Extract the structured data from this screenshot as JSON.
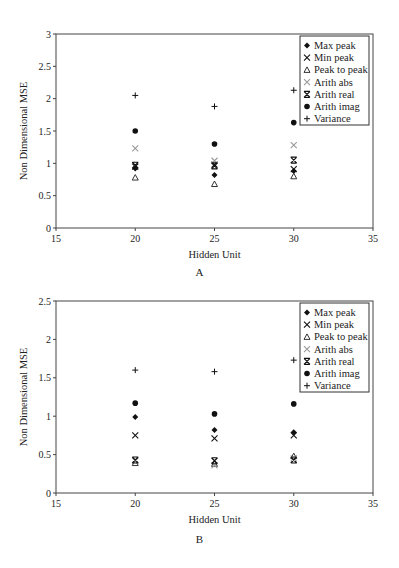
{
  "chart_data": [
    {
      "id": "A",
      "type": "scatter",
      "caption": "A",
      "title": "",
      "xlabel": "Hidden Unit",
      "ylabel": "Non Dimensional MSE",
      "xlim": [
        15,
        35
      ],
      "ylim": [
        0,
        3
      ],
      "xticks": [
        15,
        20,
        25,
        30,
        35
      ],
      "yticks": [
        0,
        0.5,
        1,
        1.5,
        2,
        2.5,
        3
      ],
      "ytick_labels": [
        "0",
        "0.5",
        "1",
        "1.5",
        "2",
        "2.5",
        "3"
      ],
      "grid": false,
      "legend_position": "upper right",
      "x": [
        20,
        25,
        30
      ],
      "series": [
        {
          "name": "Max peak",
          "marker": "diamond",
          "color": "#111111",
          "values": [
            0.92,
            0.82,
            0.88
          ]
        },
        {
          "name": "Min peak",
          "marker": "x",
          "color": "#111111",
          "values": [
            0.95,
            0.98,
            0.91
          ]
        },
        {
          "name": "Peak to peak",
          "marker": "triangle",
          "color": "#333333",
          "values": [
            0.78,
            0.68,
            0.8
          ]
        },
        {
          "name": "Arith abs",
          "marker": "x-light",
          "color": "#999999",
          "values": [
            1.23,
            1.04,
            1.28
          ]
        },
        {
          "name": "Arith real",
          "marker": "asterisk",
          "color": "#111111",
          "values": [
            0.97,
            0.96,
            1.05
          ]
        },
        {
          "name": "Arith imag",
          "marker": "circle",
          "color": "#111111",
          "values": [
            1.5,
            1.3,
            1.63
          ]
        },
        {
          "name": "Variance",
          "marker": "plus",
          "color": "#111111",
          "values": [
            2.05,
            1.88,
            2.13
          ]
        }
      ]
    },
    {
      "id": "B",
      "type": "scatter",
      "caption": "B",
      "title": "",
      "xlabel": "Hidden Unit",
      "ylabel": "Non Dimensional MSE",
      "xlim": [
        15,
        35
      ],
      "ylim": [
        0,
        2.5
      ],
      "xticks": [
        15,
        20,
        25,
        30,
        35
      ],
      "yticks": [
        0,
        0.5,
        1,
        1.5,
        2,
        2.5
      ],
      "ytick_labels": [
        "0",
        "0.5",
        "1",
        "1.5",
        "2",
        "2.5"
      ],
      "grid": false,
      "legend_position": "upper right",
      "x": [
        20,
        25,
        30
      ],
      "series": [
        {
          "name": "Max peak",
          "marker": "diamond",
          "color": "#111111",
          "values": [
            0.99,
            0.82,
            0.79
          ]
        },
        {
          "name": "Min peak",
          "marker": "x",
          "color": "#111111",
          "values": [
            0.75,
            0.71,
            0.75
          ]
        },
        {
          "name": "Peak to peak",
          "marker": "triangle",
          "color": "#333333",
          "values": [
            0.39,
            0.38,
            0.48
          ]
        },
        {
          "name": "Arith abs",
          "marker": "x-light",
          "color": "#999999",
          "values": [
            0.42,
            0.36,
            0.45
          ]
        },
        {
          "name": "Arith real",
          "marker": "asterisk",
          "color": "#111111",
          "values": [
            0.43,
            0.42,
            0.43
          ]
        },
        {
          "name": "Arith imag",
          "marker": "circle",
          "color": "#111111",
          "values": [
            1.17,
            1.03,
            1.16
          ]
        },
        {
          "name": "Variance",
          "marker": "plus",
          "color": "#111111",
          "values": [
            1.6,
            1.58,
            1.73
          ]
        }
      ]
    }
  ]
}
